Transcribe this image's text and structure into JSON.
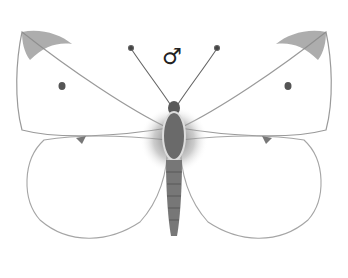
{
  "illustration": {
    "subject": "male white butterfly (dorsal view)",
    "sex_symbol": "♂",
    "colors": {
      "wing_fill": "#ffffff",
      "wing_outline": "#9a9a9a",
      "wing_tip": "#8a8a8a",
      "spot": "#555555",
      "body": "#6a6a6a",
      "hair": "#8a8a8a"
    }
  }
}
